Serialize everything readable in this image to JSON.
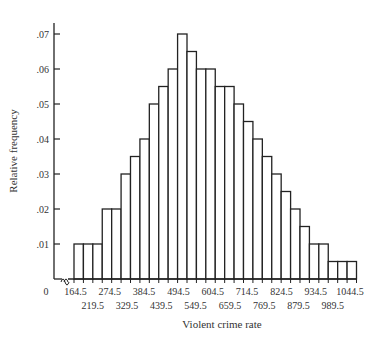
{
  "chart_data": {
    "type": "bar",
    "subtype": "histogram",
    "title": "",
    "xlabel": "Violent crime rate",
    "ylabel": "Relative frequency",
    "bin_start": 164.5,
    "bin_width": 27.5,
    "x_tick_labels_upper": [
      "0",
      "164.5",
      "274.5",
      "384.5",
      "494.5",
      "604.5",
      "714.5",
      "824.5",
      "934.5",
      "1044.5"
    ],
    "x_tick_labels_lower": [
      "219.5",
      "329.5",
      "439.5",
      "549.5",
      "659.5",
      "769.5",
      "879.5",
      "989.5"
    ],
    "y_tick_labels": [
      ".01",
      ".02",
      ".03",
      ".04",
      ".05",
      ".06",
      ".07"
    ],
    "y_ticks": [
      0.01,
      0.02,
      0.03,
      0.04,
      0.05,
      0.06,
      0.07
    ],
    "ylim": [
      0,
      0.07
    ],
    "axis_break": true,
    "grid": false,
    "legend": null,
    "values": [
      0.01,
      0.01,
      0.01,
      0.02,
      0.02,
      0.03,
      0.035,
      0.04,
      0.05,
      0.055,
      0.06,
      0.07,
      0.065,
      0.06,
      0.06,
      0.055,
      0.055,
      0.05,
      0.045,
      0.04,
      0.035,
      0.03,
      0.025,
      0.02,
      0.015,
      0.01,
      0.01,
      0.005,
      0.005,
      0.005
    ],
    "colors": {
      "bar_fill": "#ffffff",
      "bar_stroke": "#222222",
      "axis": "#222222"
    }
  }
}
